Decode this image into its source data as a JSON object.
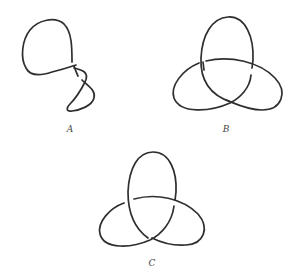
{
  "figure": {
    "stroke_color": "#2f2f2f",
    "background": "#ffffff",
    "knots": [
      {
        "id": "A",
        "label": "A",
        "description": "Knot diagram with a large loop and two crossings (a deformed projection)"
      },
      {
        "id": "B",
        "label": "B",
        "description": "Trefoil knot diagram with three crossings"
      },
      {
        "id": "C",
        "label": "C",
        "description": "Trefoil knot diagram with three crossings (mirror crossings)"
      }
    ]
  }
}
